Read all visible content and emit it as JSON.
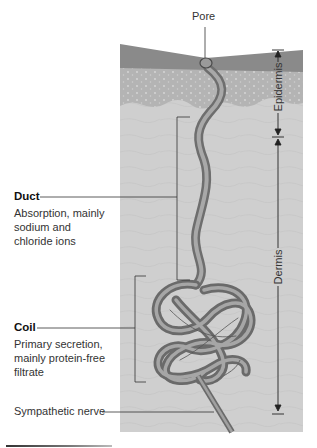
{
  "diagram": {
    "type": "anatomical-illustration",
    "labels": {
      "pore": "Pore",
      "epidermis": "Epidermis",
      "dermis": "Dermis",
      "duct_title": "Duct",
      "duct_desc": [
        "Absorption, mainly",
        "sodium and",
        "chloride ions"
      ],
      "coil_title": "Coil",
      "coil_desc": [
        "Primary secretion,",
        "mainly protein-free",
        "filtrate"
      ],
      "nerve": "Sympathetic nerve"
    },
    "colors": {
      "stratum_corneum": "#8a8a8a",
      "epidermis_light": "#b4b4b4",
      "dermis": "#cfcfcf",
      "gland": "#7f7f7f",
      "gland_highlight": "#a6a6a6",
      "line": "#333333"
    }
  }
}
